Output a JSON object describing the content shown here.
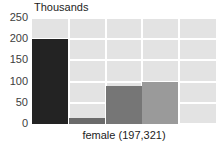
{
  "chart_data": {
    "type": "bar",
    "title": "",
    "unit_label": "Thousands",
    "xlabel": "female (197,321)",
    "ylabel": "",
    "categories": [
      "1",
      "2",
      "3",
      "4",
      "5"
    ],
    "values": [
      200,
      15,
      90,
      98,
      0
    ],
    "ylim": [
      0,
      250
    ],
    "yticks": [
      250,
      200,
      150,
      100,
      50,
      0
    ],
    "ytick_labels": [
      "250",
      "200",
      "150",
      "100",
      "50",
      "0"
    ],
    "grid": true,
    "grid_color": "#ffffff",
    "legend": "none",
    "plot_background": "#e3e3e3",
    "bar_colors": [
      "#232323",
      "#6b6b6b",
      "#767676",
      "#9a9a9a",
      "#e3e3e3"
    ]
  },
  "caption": {
    "text": "female (197,321)"
  }
}
